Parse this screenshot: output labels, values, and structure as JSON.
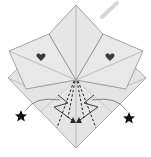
{
  "diagram": {
    "type": "origami-fold-step",
    "colors": {
      "paper": "#e2e2e2",
      "paper_light": "#ececec",
      "edge": "#8a8a8a",
      "fold_line": "#9a9a9a",
      "symbol": "#2a2a2a",
      "hint_arrow": "#d4d4d4"
    },
    "symbols": {
      "hearts": [
        "heart-left",
        "heart-right"
      ],
      "stars": [
        "star-left",
        "star-right"
      ],
      "arrows": [
        "zigzag-arrow-left",
        "zigzag-arrow-right",
        "swing-arrow-left",
        "swing-arrow-right"
      ],
      "fold_lines": [
        "valley-fold-dashed-1",
        "valley-fold-dashed-2",
        "valley-fold-dashed-3",
        "valley-fold-dashed-4"
      ]
    }
  }
}
